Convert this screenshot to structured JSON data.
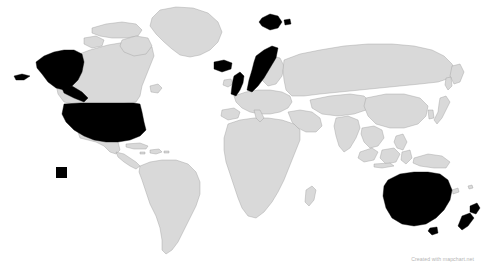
{
  "map": {
    "title": "World Map",
    "projection": "equirectangular",
    "width": 492,
    "height": 271,
    "ocean_color": "#ffffff",
    "land_color": "#d9d9d9",
    "border_color": "#9a9a9a",
    "highlight_color": "#000000",
    "legend_present": false,
    "antarctica_shown": false,
    "highlighted_regions": [
      "United States",
      "Alaska",
      "Hawaii",
      "Iceland",
      "United Kingdom",
      "Norway",
      "Svalbard",
      "Australia",
      "Tasmania",
      "New Zealand"
    ],
    "inset": {
      "name": "hawaii-inset",
      "label": "Hawaii",
      "color": "#000000"
    }
  },
  "attribution": {
    "text": "Created with mapchart.net",
    "color": "#b4b4b4"
  }
}
